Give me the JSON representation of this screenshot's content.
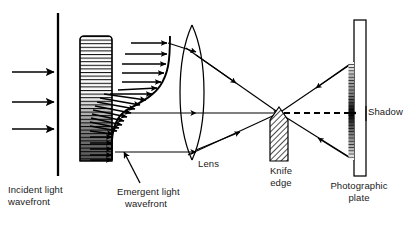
{
  "figure": {
    "type": "optics-ray-diagram",
    "background_color": "#ffffff",
    "ink_color": "#000000",
    "width": 416,
    "height": 225
  },
  "labels": {
    "incident": "Incident light\nwavefront",
    "incident_line1": "Incident light",
    "incident_line2": "wavefront",
    "emergent_line1": "Emergent light",
    "emergent_line2": "wavefront",
    "lens": "Lens",
    "knife_line1": "Knife",
    "knife_line2": "edge",
    "plate_line1": "Photographic",
    "plate_line2": "plate",
    "shadow": "Shadow"
  },
  "elements": {
    "incident_wavefront": {
      "name": "incident-wavefront-line",
      "x": 58,
      "y_top": 13,
      "y_bottom": 176,
      "stroke_width": 2.2
    },
    "incident_rays": {
      "name": "incident-ray-arrows",
      "count": 3,
      "x_start": 12,
      "x_end": 56,
      "ys": [
        72,
        102,
        129
      ]
    },
    "test_section": {
      "name": "striated-test-section",
      "x": 80,
      "y": 36,
      "width": 32,
      "height": 125,
      "stripe_count": 34,
      "gradient": "light-top-to-dark-bottom"
    },
    "emergent_wavefront": {
      "name": "emergent-wavefront-curve",
      "shape": "s-curve",
      "arrow_count": 22
    },
    "lens": {
      "name": "biconvex-lens",
      "cx": 192,
      "cy": 92,
      "half_width": 17,
      "y_top": 25,
      "y_bottom": 160
    },
    "focal_point": {
      "x": 279,
      "y": 113
    },
    "knife_edge": {
      "name": "knife-edge-block",
      "x_left": 270,
      "x_right": 288,
      "y_tip": 108,
      "y_bottom": 161,
      "fill": "diagonal-hatch"
    },
    "photographic_plate": {
      "name": "photographic-plate",
      "x_left": 354,
      "x_right": 366,
      "y_top": 20,
      "y_bottom": 176
    },
    "shadow_band": {
      "name": "shadow-gradient-band",
      "x": 348,
      "y_top": 62,
      "y_bottom": 160
    },
    "optic_axis_dashed": {
      "name": "optic-axis-dashed-line",
      "x_start": 284,
      "x_end": 353,
      "y": 113
    }
  },
  "colors": {
    "ink": "#000000",
    "text": "#1a1a1a",
    "paper": "#ffffff",
    "hatch": "#222222"
  }
}
